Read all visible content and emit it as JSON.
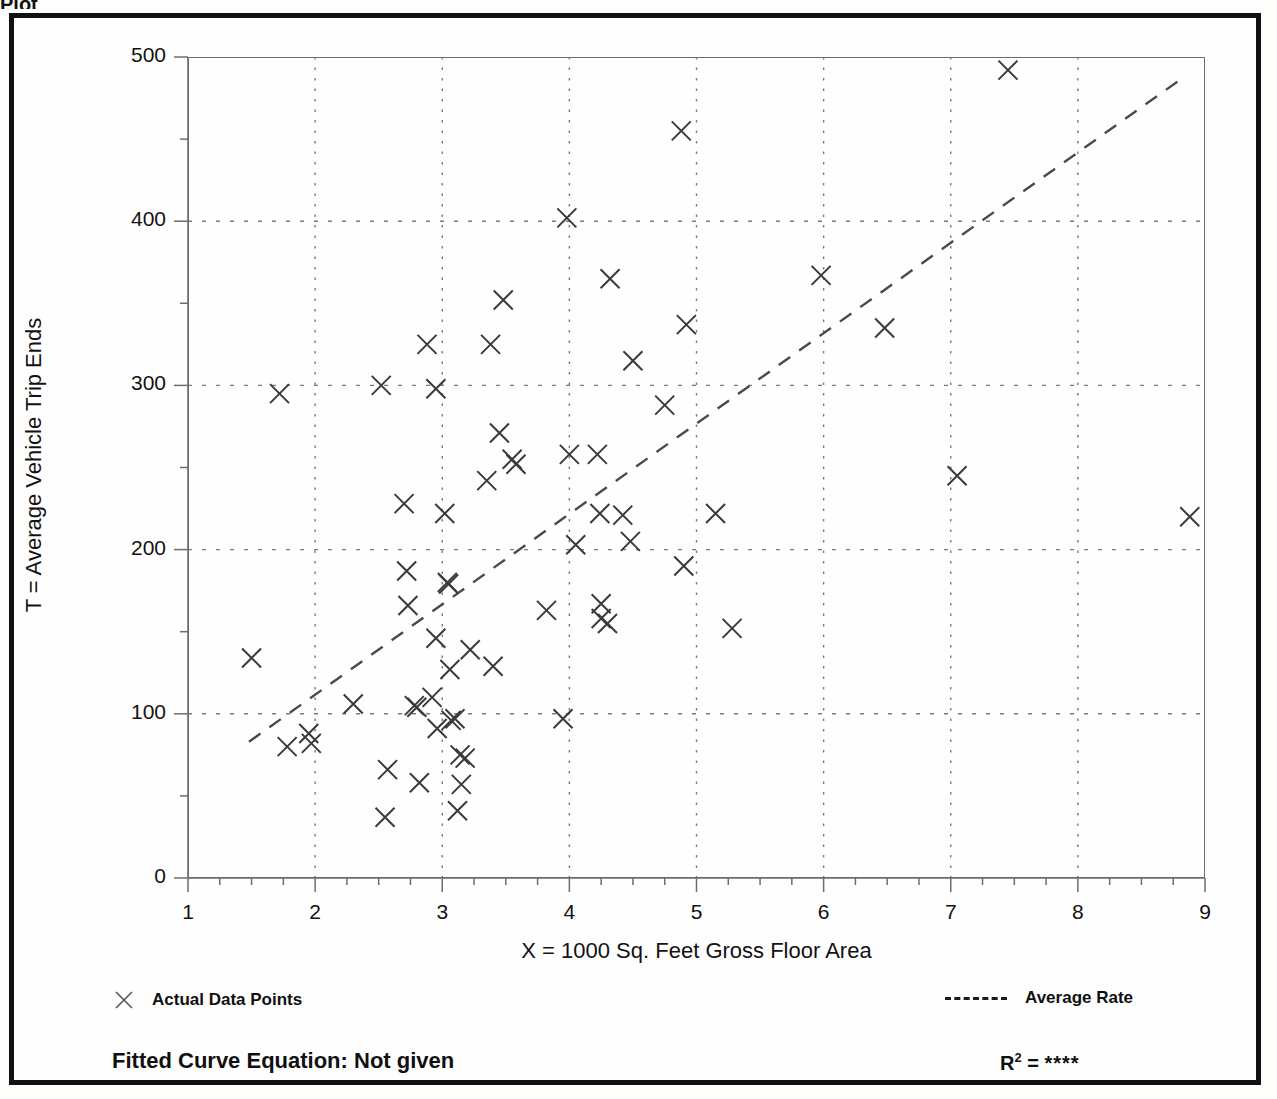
{
  "page": {
    "title_sliver": "Plot"
  },
  "chart_data": {
    "type": "scatter",
    "title": "",
    "xlabel": "X = 1000 Sq. Feet Gross Floor Area",
    "ylabel": "T = Average Vehicle Trip Ends",
    "xlim": [
      1,
      9
    ],
    "ylim": [
      0,
      500
    ],
    "xticks": [
      1,
      2,
      3,
      4,
      5,
      6,
      7,
      8,
      9
    ],
    "yticks": [
      0,
      100,
      200,
      300,
      400,
      500
    ],
    "x_minor_step": 0.25,
    "y_minor_step": 50,
    "grid": true,
    "grid_style": "dotted",
    "gridlines_x": [
      2,
      3,
      4,
      5,
      6,
      7,
      8
    ],
    "gridlines_y": [
      100,
      200,
      300,
      400
    ],
    "legend_position": "below-axes",
    "marker": "x",
    "series": [
      {
        "name": "Actual Data Points",
        "marker": "x",
        "points": [
          [
            1.5,
            134
          ],
          [
            1.72,
            295
          ],
          [
            1.78,
            80
          ],
          [
            1.95,
            88
          ],
          [
            1.97,
            82
          ],
          [
            2.3,
            106
          ],
          [
            2.52,
            300
          ],
          [
            2.55,
            37
          ],
          [
            2.57,
            66
          ],
          [
            2.7,
            228
          ],
          [
            2.72,
            187
          ],
          [
            2.73,
            166
          ],
          [
            2.78,
            105
          ],
          [
            2.8,
            104
          ],
          [
            2.82,
            58
          ],
          [
            2.88,
            325
          ],
          [
            2.92,
            110
          ],
          [
            2.95,
            298
          ],
          [
            2.95,
            146
          ],
          [
            2.96,
            91
          ],
          [
            3.02,
            222
          ],
          [
            3.04,
            180
          ],
          [
            3.05,
            179
          ],
          [
            3.06,
            127
          ],
          [
            3.07,
            96
          ],
          [
            3.1,
            97
          ],
          [
            3.12,
            41
          ],
          [
            3.14,
            75
          ],
          [
            3.15,
            57
          ],
          [
            3.18,
            73
          ],
          [
            3.22,
            139
          ],
          [
            3.35,
            242
          ],
          [
            3.38,
            325
          ],
          [
            3.4,
            129
          ],
          [
            3.45,
            271
          ],
          [
            3.48,
            352
          ],
          [
            3.55,
            255
          ],
          [
            3.58,
            252
          ],
          [
            3.82,
            163
          ],
          [
            3.95,
            97
          ],
          [
            3.98,
            402
          ],
          [
            4.0,
            258
          ],
          [
            4.05,
            203
          ],
          [
            4.22,
            258
          ],
          [
            4.24,
            222
          ],
          [
            4.25,
            167
          ],
          [
            4.25,
            158
          ],
          [
            4.3,
            155
          ],
          [
            4.32,
            365
          ],
          [
            4.42,
            221
          ],
          [
            4.48,
            205
          ],
          [
            4.5,
            315
          ],
          [
            4.75,
            288
          ],
          [
            4.88,
            455
          ],
          [
            4.9,
            190
          ],
          [
            4.92,
            337
          ],
          [
            5.15,
            222
          ],
          [
            5.28,
            152
          ],
          [
            5.98,
            367
          ],
          [
            6.48,
            335
          ],
          [
            7.05,
            245
          ],
          [
            7.45,
            492
          ],
          [
            8.88,
            220
          ]
        ]
      }
    ],
    "trendline": {
      "name": "Average Rate",
      "style": "dashed",
      "x_start": 1.48,
      "y_start": 83,
      "x_end": 8.82,
      "y_end": 487
    }
  },
  "legend": {
    "actual_label": "Actual Data Points",
    "average_label": "Average Rate",
    "marker_icon": "x-marker-icon",
    "line_icon": "dashed-line-icon"
  },
  "footer": {
    "fitted_equation": "Fitted Curve Equation:  Not given",
    "r_label": "R",
    "r_exponent": "2",
    "r_equals": " = ",
    "r_value": "****"
  },
  "colors": {
    "ink": "#121212",
    "frame": "#111111",
    "axis": "#6d6d6d",
    "grid": "#7a7a7a",
    "marker": "#3a3a3a"
  }
}
